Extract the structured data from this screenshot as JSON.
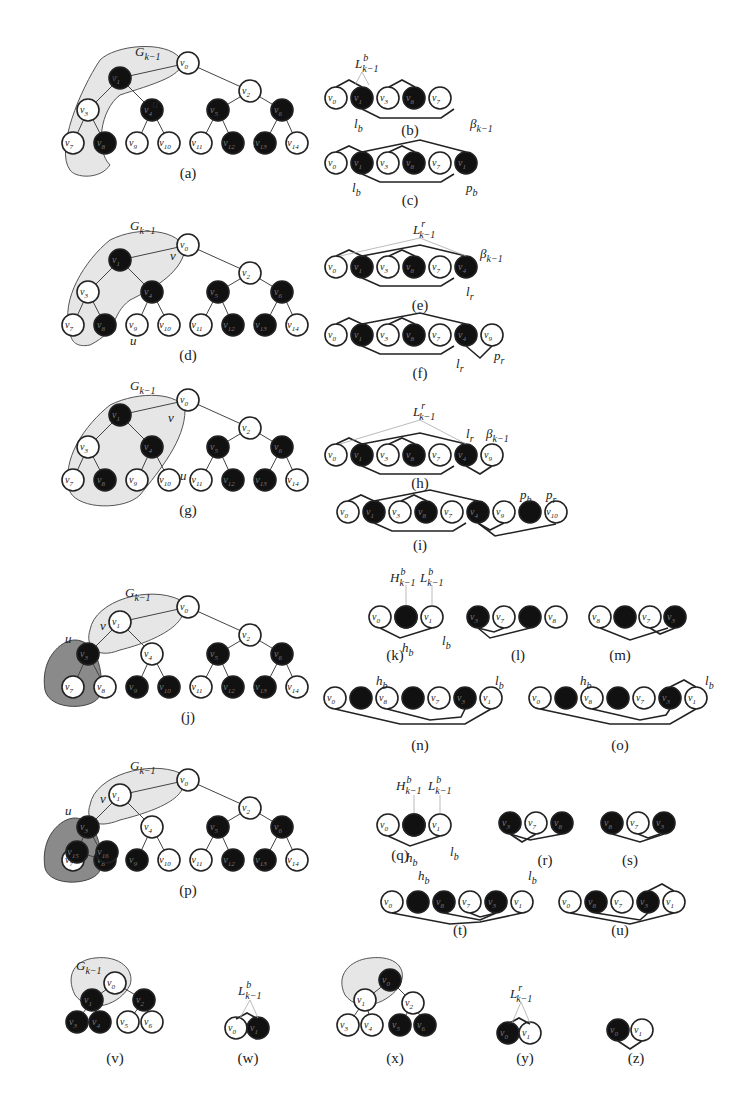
{
  "figure": {
    "panels": [
      {
        "id": "a",
        "label": "(a)",
        "type": "tree",
        "region_label": "G_{k-1}",
        "annotations": {
          "v": "v",
          "u": "u"
        },
        "nodes": [
          {
            "id": "v0",
            "black": false
          },
          {
            "id": "v1",
            "black": true
          },
          {
            "id": "v2",
            "black": false
          },
          {
            "id": "v3",
            "black": false
          },
          {
            "id": "v4",
            "black": true
          },
          {
            "id": "v5",
            "black": true
          },
          {
            "id": "v6",
            "black": true
          },
          {
            "id": "v7",
            "black": false
          },
          {
            "id": "v8",
            "black": true
          },
          {
            "id": "v9",
            "black": false
          },
          {
            "id": "v10",
            "black": false
          },
          {
            "id": "v11",
            "black": false
          },
          {
            "id": "v12",
            "black": true
          },
          {
            "id": "v13",
            "black": true
          },
          {
            "id": "v14",
            "black": false
          }
        ]
      },
      {
        "id": "b",
        "label": "(b)",
        "type": "sequence",
        "sequence": [
          "v0",
          "v1",
          "v3",
          "v8",
          "v7"
        ],
        "annotations": [
          "L^b_{k-1}",
          "l_b",
          "β_{k-1}"
        ]
      },
      {
        "id": "c",
        "label": "(c)",
        "type": "sequence",
        "sequence": [
          "v0",
          "v1",
          "v3",
          "v8",
          "v7",
          "v1"
        ],
        "annotations": [
          "l_b",
          "p_b"
        ]
      },
      {
        "id": "d",
        "label": "(d)",
        "type": "tree",
        "region_label": "G_{k-1}",
        "annotations": {
          "v": "v",
          "u": "u"
        }
      },
      {
        "id": "e",
        "label": "(e)",
        "type": "sequence",
        "sequence": [
          "v0",
          "v1",
          "v3",
          "v8",
          "v7",
          "v4"
        ],
        "annotations": [
          "L^r_{k-1}",
          "β_{k-1}",
          "l_r"
        ]
      },
      {
        "id": "f",
        "label": "(f)",
        "type": "sequence",
        "sequence": [
          "v0",
          "v1",
          "v3",
          "v8",
          "v7",
          "v4",
          "v9"
        ],
        "annotations": [
          "l_r",
          "p_r"
        ]
      },
      {
        "id": "g",
        "label": "(g)",
        "type": "tree",
        "region_label": "G_{k-1}",
        "annotations": {
          "v": "v",
          "u": "u"
        }
      },
      {
        "id": "h",
        "label": "(h)",
        "type": "sequence",
        "sequence": [
          "v0",
          "v1",
          "v3",
          "v8",
          "v7",
          "v4",
          "v9"
        ],
        "annotations": [
          "L^r_{k-1}",
          "l_r",
          "β_{k-1}"
        ]
      },
      {
        "id": "i",
        "label": "(i)",
        "type": "sequence",
        "sequence": [
          "v0",
          "v1",
          "v3",
          "v8",
          "v7",
          "v4",
          "v9",
          "•",
          "v10"
        ],
        "annotations": [
          "p_b",
          "p_r"
        ]
      },
      {
        "id": "j",
        "label": "(j)",
        "type": "tree",
        "region_label": "G_{k-1}",
        "annotations": {
          "v": "v",
          "u": "u"
        }
      },
      {
        "id": "k",
        "label": "(k)",
        "type": "sequence",
        "sequence": [
          "v0",
          "•",
          "v1"
        ],
        "annotations": [
          "H^b_{k-1}",
          "L^b_{k-1}",
          "h_b",
          "l_b"
        ]
      },
      {
        "id": "l",
        "label": "(l)",
        "type": "sequence",
        "sequence": [
          "v3",
          "v7",
          "•",
          "v8"
        ]
      },
      {
        "id": "m",
        "label": "(m)",
        "type": "sequence",
        "sequence": [
          "v8",
          "•",
          "v7",
          "v3"
        ]
      },
      {
        "id": "n",
        "label": "(n)",
        "type": "sequence",
        "sequence": [
          "v0",
          "•",
          "v8",
          "•",
          "v7",
          "v3",
          "v1"
        ],
        "annotations": [
          "h_b",
          "l_b"
        ]
      },
      {
        "id": "o",
        "label": "(o)",
        "type": "sequence",
        "sequence": [
          "v0",
          "•",
          "v8",
          "•",
          "v7",
          "v3",
          "v1"
        ],
        "annotations": [
          "h_b",
          "l_b"
        ]
      },
      {
        "id": "p",
        "label": "(p)",
        "type": "tree",
        "region_label": "G_{k-1}",
        "annotations": {
          "v": "v",
          "u": "u"
        }
      },
      {
        "id": "q",
        "label": "(q)",
        "type": "sequence",
        "sequence": [
          "v0",
          "•",
          "v1"
        ],
        "annotations": [
          "H^b_{k-1}",
          "L^b_{k-1}",
          "h_b",
          "l_b"
        ]
      },
      {
        "id": "r",
        "label": "(r)",
        "type": "sequence",
        "sequence": [
          "v3",
          "v7",
          "v8"
        ]
      },
      {
        "id": "s",
        "label": "(s)",
        "type": "sequence",
        "sequence": [
          "v8",
          "v7",
          "v3"
        ]
      },
      {
        "id": "t",
        "label": "(t)",
        "type": "sequence",
        "sequence": [
          "v0",
          "•",
          "v8",
          "v7",
          "v3",
          "v1"
        ],
        "annotations": [
          "h_b",
          "l_b"
        ]
      },
      {
        "id": "u",
        "label": "(u)",
        "type": "sequence",
        "sequence": [
          "v0",
          "v8",
          "v7",
          "v3",
          "v1"
        ]
      },
      {
        "id": "v",
        "label": "(v)",
        "type": "tree",
        "region_label": "G_{k-1}"
      },
      {
        "id": "w",
        "label": "(w)",
        "type": "sequence",
        "sequence": [
          "v0",
          "v1"
        ],
        "annotations": [
          "L^b_{k-1}"
        ]
      },
      {
        "id": "x",
        "label": "(x)",
        "type": "tree"
      },
      {
        "id": "y",
        "label": "(y)",
        "type": "sequence",
        "sequence": [
          "v0",
          "v1"
        ],
        "annotations": [
          "L^r_{k-1}"
        ]
      },
      {
        "id": "z",
        "label": "(z)",
        "type": "sequence",
        "sequence": [
          "v0",
          "v1"
        ]
      }
    ]
  }
}
